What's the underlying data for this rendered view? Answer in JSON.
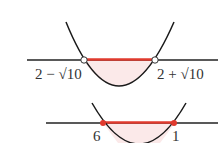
{
  "diagram": {
    "colors": {
      "axis": "#222222",
      "curve": "#1a1a1a",
      "highlight": "#e03a2e",
      "fill": "#fbe9e9"
    },
    "top": {
      "left_root_label": "2 − √10",
      "right_root_label": "2 + √10",
      "endpoints": "open",
      "interval_highlight": "between roots"
    },
    "bottom": {
      "left_root_label": "6",
      "right_root_label": "1",
      "endpoints": "closed",
      "interval_highlight": "between roots"
    }
  }
}
